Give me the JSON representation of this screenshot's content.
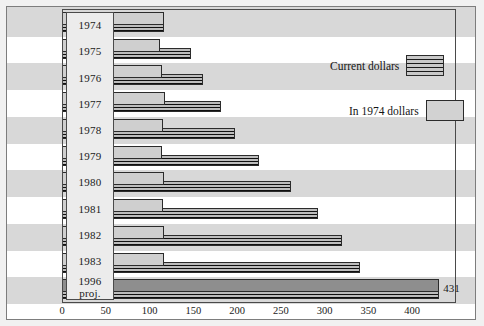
{
  "chart_data": {
    "type": "bar",
    "orientation": "horizontal",
    "title": "",
    "xlabel": "",
    "ylabel": "",
    "xlim": [
      0,
      450
    ],
    "grid": false,
    "bands": true,
    "categories": [
      "1974",
      "1975",
      "1976",
      "1977",
      "1978",
      "1979",
      "1980",
      "1981",
      "1982",
      "1983",
      "1996 proj."
    ],
    "series": [
      {
        "name": "Current dollars",
        "pattern": "horizontal-stripes",
        "values": [
          117,
          147,
          161,
          182,
          198,
          225,
          261,
          292,
          320,
          340,
          431
        ]
      },
      {
        "name": "In 1974 dollars",
        "pattern": "solid-light",
        "values": [
          117,
          112,
          114,
          118,
          115,
          114,
          117,
          115,
          117,
          116,
          161
        ]
      }
    ],
    "data_labels": [
      {
        "category": "1996 proj.",
        "series": "Current dollars",
        "value": 431,
        "text": "431"
      }
    ],
    "xticks": [
      0,
      50,
      100,
      150,
      200,
      250,
      300,
      350,
      400
    ],
    "xticklabels": [
      "0",
      "50",
      "100",
      "150",
      "200",
      "250",
      "300",
      "350",
      "400"
    ]
  },
  "legend": {
    "position": "top-right",
    "entries": [
      {
        "label": "Current dollars",
        "swatch": "striped-swatch"
      },
      {
        "label": "In 1974 dollars",
        "swatch": "plain-swatch"
      }
    ]
  },
  "year_labels": [
    {
      "line1": "1974",
      "line2": ""
    },
    {
      "line1": "1975",
      "line2": ""
    },
    {
      "line1": "1976",
      "line2": ""
    },
    {
      "line1": "1977",
      "line2": ""
    },
    {
      "line1": "1978",
      "line2": ""
    },
    {
      "line1": "1979",
      "line2": ""
    },
    {
      "line1": "1980",
      "line2": ""
    },
    {
      "line1": "1981",
      "line2": ""
    },
    {
      "line1": "1982",
      "line2": ""
    },
    {
      "line1": "1983",
      "line2": ""
    },
    {
      "line1": "1996",
      "line2": "proj."
    }
  ],
  "colors": {
    "background": "#d8d8d8",
    "band": "#ffffff",
    "frame_border": "#4a4a4a",
    "bar_current": "#101010",
    "bar_real": "#cfcfcf",
    "bar_projection": "#8e8e8e",
    "text": "#1a1a1a"
  }
}
